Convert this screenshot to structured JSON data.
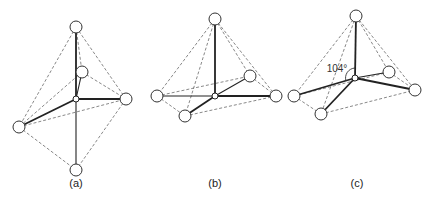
{
  "figure": {
    "panels": [
      {
        "id": "a",
        "label": "(a)",
        "center": [
          76,
          99
        ],
        "atoms": [
          [
            76,
            27
          ],
          [
            82,
            72
          ],
          [
            126,
            99
          ],
          [
            19,
            127
          ],
          [
            76,
            170
          ]
        ],
        "description": "Octahedral-like arrangement: center with bonds to top, right, left, bottom and a back atom"
      },
      {
        "id": "b",
        "label": "(b)",
        "center": [
          215,
          96
        ],
        "atoms": [
          [
            215,
            19
          ],
          [
            250,
            76
          ],
          [
            276,
            96
          ],
          [
            157,
            96
          ],
          [
            185,
            116
          ]
        ],
        "description": "Trigonal bipyramid-like with center in equatorial plane"
      },
      {
        "id": "c",
        "label": "(c)",
        "center": [
          355,
          78
        ],
        "atoms": [
          [
            356,
            16
          ],
          [
            389,
            72
          ],
          [
            415,
            90
          ],
          [
            294,
            96
          ],
          [
            321,
            114
          ]
        ],
        "angle_label": "104°",
        "description": "Tetrahedral arrangement with marked 104° bond angle"
      }
    ]
  }
}
